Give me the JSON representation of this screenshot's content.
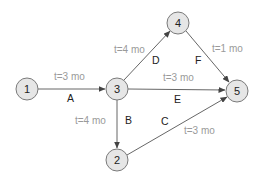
{
  "diagram": {
    "type": "activity-on-arrow network",
    "nodes": [
      {
        "id": "1",
        "label": "1",
        "x": 27,
        "y": 89
      },
      {
        "id": "3",
        "label": "3",
        "x": 117,
        "y": 89
      },
      {
        "id": "4",
        "label": "4",
        "x": 178,
        "y": 23
      },
      {
        "id": "5",
        "label": "5",
        "x": 237,
        "y": 91
      },
      {
        "id": "2",
        "label": "2",
        "x": 117,
        "y": 160
      }
    ],
    "edges": [
      {
        "id": "A",
        "from": "1",
        "to": "3",
        "activity": "A",
        "time": "t=3 mo"
      },
      {
        "id": "B",
        "from": "3",
        "to": "2",
        "activity": "B",
        "time": "t=4 mo"
      },
      {
        "id": "C",
        "from": "2",
        "to": "5",
        "activity": "C",
        "time": "t=3 mo"
      },
      {
        "id": "D",
        "from": "3",
        "to": "4",
        "activity": "D",
        "time": "t=4 mo"
      },
      {
        "id": "E",
        "from": "3",
        "to": "5",
        "activity": "E",
        "time": "t=3 mo"
      },
      {
        "id": "F",
        "from": "4",
        "to": "5",
        "activity": "F",
        "time": "t=1 mo"
      }
    ]
  }
}
